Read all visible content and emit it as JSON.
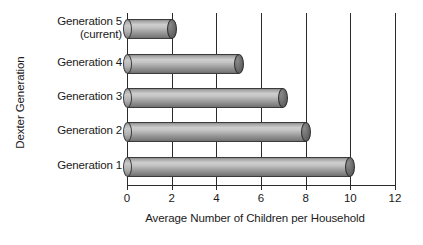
{
  "chart_data": {
    "type": "bar",
    "orientation": "horizontal",
    "title": "",
    "xlabel": "Average Number of Children per Household",
    "ylabel": "Dexter Generation",
    "categories": [
      "Generation 5\n(current)",
      "Generation 4",
      "Generation 3",
      "Generation 2",
      "Generation 1"
    ],
    "values": [
      2,
      5,
      7,
      8,
      10
    ],
    "xticks": [
      0,
      2,
      4,
      6,
      8,
      10,
      12
    ],
    "xtick_labels": [
      "0",
      "2",
      "4",
      "6",
      "8",
      "10",
      "12"
    ],
    "xlim": [
      0,
      12
    ],
    "grid": "vertical",
    "legend": null,
    "bar_style": "3d-cylinder",
    "colors": {
      "bar_light": "#cfcfcf",
      "bar_mid": "#a5a5a5",
      "bar_dark": "#6e6e6e",
      "cap": "#4e4e4e",
      "axis": "#2b2b2b",
      "text": "#1a1a1a",
      "background": "#ffffff"
    }
  }
}
